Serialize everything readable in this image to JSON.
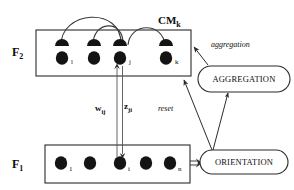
{
  "diagram": {
    "layers": [
      {
        "id": "F2",
        "label": "F",
        "sub": "2",
        "label_x": 12,
        "label_y": 38,
        "box": {
          "x": 36,
          "y": 30,
          "w": 155,
          "h": 46
        },
        "nodes": [
          {
            "label": "l",
            "cx": 62,
            "cy": 58,
            "has_cap": true
          },
          {
            "label": "",
            "cx": 94,
            "cy": 58,
            "has_cap": true
          },
          {
            "label": "j",
            "cx": 120,
            "cy": 58,
            "has_cap": true
          },
          {
            "label": "k",
            "cx": 166,
            "cy": 58,
            "has_cap": true
          }
        ]
      },
      {
        "id": "F1",
        "label": "F",
        "sub": "1",
        "label_x": 12,
        "label_y": 157,
        "box": {
          "x": 45,
          "y": 145,
          "w": 145,
          "h": 38
        },
        "nodes": [
          {
            "label": "1",
            "cx": 61,
            "cy": 163,
            "has_cap": false
          },
          {
            "label": "",
            "cx": 90,
            "cy": 163,
            "has_cap": false
          },
          {
            "label": "i",
            "cx": 120,
            "cy": 163,
            "has_cap": false
          },
          {
            "label": "",
            "cx": 146,
            "cy": 163,
            "has_cap": false
          },
          {
            "label": "n",
            "cx": 170,
            "cy": 163,
            "has_cap": false
          }
        ]
      }
    ],
    "cm_label": {
      "text": "CM",
      "sub": "k",
      "x": 158,
      "y": 15
    },
    "weights": [
      {
        "text": "w",
        "sub": "ij",
        "x": 96,
        "y": 103
      },
      {
        "text": "z",
        "sub": "ji",
        "x": 124,
        "y": 101
      }
    ],
    "signal_labels": [
      {
        "name": "aggregation",
        "text": "aggregation",
        "x": 210,
        "y": 42
      },
      {
        "name": "reset",
        "text": "reset",
        "x": 159,
        "y": 106
      }
    ],
    "modules": [
      {
        "id": "aggregation",
        "text": "AGGREGATION",
        "x": 198,
        "y": 66,
        "w": 92,
        "h": 26
      },
      {
        "id": "orientation",
        "text": "ORIENTATION",
        "x": 200,
        "y": 150,
        "w": 88,
        "h": 24
      }
    ],
    "colors": {
      "stroke": "#2b2b2b",
      "node_fill": "#141414",
      "background": "#ffffff",
      "text": "#0d0d0d"
    },
    "arcs_description": "three lateral feedback arcs over F2 nodes",
    "connections": [
      {
        "from": "F2-node-j",
        "to": "F1-node-i",
        "kind": "double-line-down"
      },
      {
        "from": "F1-node-i",
        "to": "F2-node-j",
        "kind": "double-line-up"
      },
      {
        "from": "F1",
        "to": "ORIENTATION",
        "kind": "double-arrow-right"
      },
      {
        "from": "AGGREGATION",
        "to": "F2",
        "kind": "arrow-up-left"
      },
      {
        "from": "ORIENTATION",
        "to": "F2",
        "kind": "arrow-up-left"
      },
      {
        "from": "ORIENTATION",
        "to": "AGGREGATION",
        "kind": "arrow-up"
      }
    ]
  }
}
